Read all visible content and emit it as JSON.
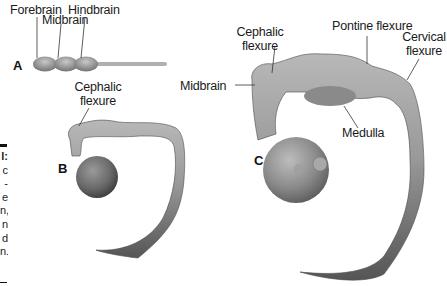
{
  "figure": {
    "panels": [
      {
        "id": "A",
        "labels": [
          "Forebrain",
          "Midbrain",
          "Hindbrain"
        ]
      },
      {
        "id": "B",
        "labels": [
          "Cephalic flexure"
        ]
      },
      {
        "id": "C",
        "labels": [
          "Cephalic flexure",
          "Pontine flexure",
          "Cervical flexure",
          "Midbrain",
          "Medulla"
        ]
      }
    ],
    "labels": {
      "forebrain": "Forebrain",
      "midbrain_a": "Midbrain",
      "hindbrain": "Hindbrain",
      "cephalic_b_1": "Cephalic",
      "cephalic_b_2": "flexure",
      "cephalic_c_1": "Cephalic",
      "cephalic_c_2": "flexure",
      "pontine": "Pontine flexure",
      "cervical_1": "Cervical",
      "cervical_2": "flexure",
      "midbrain_c": "Midbrain",
      "medulla": "Medulla"
    },
    "panel_letters": {
      "a": "A",
      "b": "B",
      "c": "C"
    },
    "caption_fragments": [
      "l:",
      "c",
      "-",
      "e",
      "n,",
      "n",
      "d",
      "n."
    ],
    "colors": {
      "tissue_light": "#c8c8c8",
      "tissue_mid": "#8e8e8e",
      "tissue_dark": "#4a4a4a",
      "text": "#1a1a1a"
    }
  }
}
